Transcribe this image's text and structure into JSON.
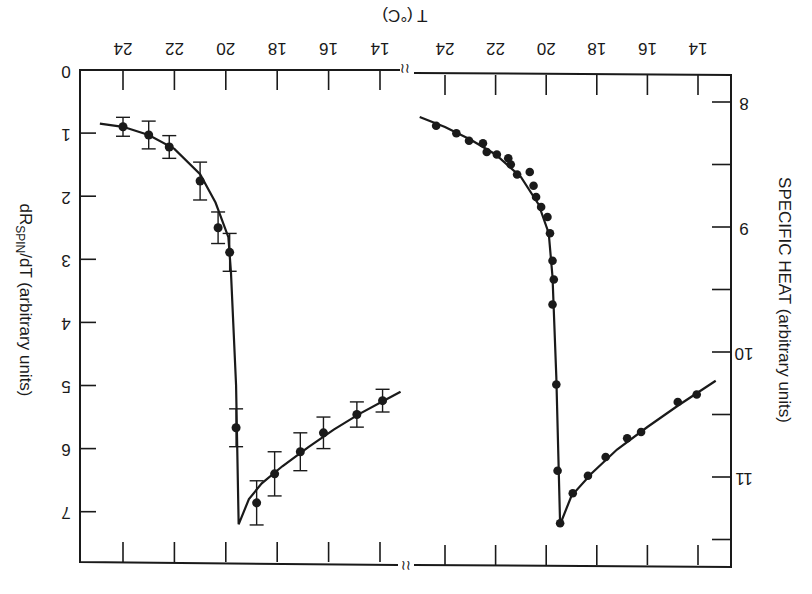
{
  "chart_data": [
    {
      "type": "scatter",
      "orientation": "rotated-180",
      "title": "",
      "xlabel": "T (°C)",
      "ylabel": "dR_SPIN/dT (arbitrary units)",
      "ylabel_main": "dR",
      "ylabel_sub": "SPIN",
      "ylabel_rest": "/dT (arbitrary units)",
      "xticks": [
        24,
        22,
        20,
        18,
        16,
        14
      ],
      "yticks": [
        0,
        1,
        2,
        3,
        4,
        5,
        6,
        7
      ],
      "xlim": [
        24.8,
        12.8
      ],
      "ylim": [
        0,
        7.8
      ],
      "error_bars": true,
      "points": [
        {
          "T": 24.0,
          "v": 0.9,
          "err": 0.15
        },
        {
          "T": 23.0,
          "v": 1.03,
          "err": 0.22
        },
        {
          "T": 22.2,
          "v": 1.22,
          "err": 0.18
        },
        {
          "T": 21.0,
          "v": 1.76,
          "err": 0.3
        },
        {
          "T": 20.3,
          "v": 2.5,
          "err": 0.25
        },
        {
          "T": 19.85,
          "v": 2.89,
          "err": 0.3
        },
        {
          "T": 19.6,
          "v": 5.67,
          "err": 0.3
        },
        {
          "T": 18.8,
          "v": 6.86,
          "err": 0.35
        },
        {
          "T": 18.1,
          "v": 6.4,
          "err": 0.35
        },
        {
          "T": 17.1,
          "v": 6.05,
          "err": 0.3
        },
        {
          "T": 16.2,
          "v": 5.75,
          "err": 0.25
        },
        {
          "T": 14.9,
          "v": 5.46,
          "err": 0.2
        },
        {
          "T": 13.9,
          "v": 5.24,
          "err": 0.18
        }
      ],
      "curve": [
        {
          "T": 24.9,
          "v": 0.85
        },
        {
          "T": 24.0,
          "v": 0.9
        },
        {
          "T": 23.0,
          "v": 1.03
        },
        {
          "T": 22.0,
          "v": 1.25
        },
        {
          "T": 21.0,
          "v": 1.65
        },
        {
          "T": 20.4,
          "v": 2.1
        },
        {
          "T": 19.9,
          "v": 2.65
        },
        {
          "T": 19.8,
          "v": 3.2
        },
        {
          "T": 19.6,
          "v": 5.0
        },
        {
          "T": 19.5,
          "v": 7.2
        },
        {
          "T": 19.1,
          "v": 6.8
        },
        {
          "T": 18.6,
          "v": 6.55
        },
        {
          "T": 17.8,
          "v": 6.28
        },
        {
          "T": 16.8,
          "v": 5.98
        },
        {
          "T": 15.8,
          "v": 5.7
        },
        {
          "T": 14.8,
          "v": 5.45
        },
        {
          "T": 13.8,
          "v": 5.23
        },
        {
          "T": 13.2,
          "v": 5.1
        }
      ]
    },
    {
      "type": "scatter",
      "orientation": "rotated-180",
      "title": "",
      "xlabel": "T (°C)",
      "ylabel": "SPECIFIC HEAT (arbitrary units)",
      "xticks": [
        24,
        22,
        20,
        18,
        16,
        14
      ],
      "yticks": [
        8,
        9,
        10,
        11
      ],
      "ytick_labels": [
        "8",
        "9",
        "10",
        "11"
      ],
      "xlim": [
        24.8,
        12.6
      ],
      "ylim": [
        7.5,
        11.6
      ],
      "error_bars": false,
      "points": [
        {
          "T": 24.35,
          "v": 8.19
        },
        {
          "T": 23.55,
          "v": 8.25
        },
        {
          "T": 23.05,
          "v": 8.31
        },
        {
          "T": 22.5,
          "v": 8.33
        },
        {
          "T": 22.35,
          "v": 8.4
        },
        {
          "T": 21.95,
          "v": 8.42
        },
        {
          "T": 21.5,
          "v": 8.45
        },
        {
          "T": 21.4,
          "v": 8.5
        },
        {
          "T": 21.15,
          "v": 8.58
        },
        {
          "T": 20.65,
          "v": 8.56
        },
        {
          "T": 20.5,
          "v": 8.67
        },
        {
          "T": 20.4,
          "v": 8.76
        },
        {
          "T": 20.2,
          "v": 8.84
        },
        {
          "T": 19.95,
          "v": 8.92
        },
        {
          "T": 19.85,
          "v": 9.05
        },
        {
          "T": 19.75,
          "v": 9.27
        },
        {
          "T": 19.7,
          "v": 9.42
        },
        {
          "T": 19.75,
          "v": 9.62
        },
        {
          "T": 19.6,
          "v": 10.26
        },
        {
          "T": 19.55,
          "v": 10.95
        },
        {
          "T": 19.45,
          "v": 11.37
        },
        {
          "T": 18.95,
          "v": 11.13
        },
        {
          "T": 18.35,
          "v": 10.99
        },
        {
          "T": 17.65,
          "v": 10.84
        },
        {
          "T": 16.8,
          "v": 10.69
        },
        {
          "T": 16.25,
          "v": 10.64
        },
        {
          "T": 14.8,
          "v": 10.4
        },
        {
          "T": 14.05,
          "v": 10.34
        }
      ],
      "curve": [
        {
          "T": 25.0,
          "v": 8.12
        },
        {
          "T": 24.0,
          "v": 8.2
        },
        {
          "T": 23.0,
          "v": 8.3
        },
        {
          "T": 22.0,
          "v": 8.42
        },
        {
          "T": 21.0,
          "v": 8.6
        },
        {
          "T": 20.3,
          "v": 8.82
        },
        {
          "T": 19.9,
          "v": 9.05
        },
        {
          "T": 19.75,
          "v": 9.4
        },
        {
          "T": 19.6,
          "v": 10.2
        },
        {
          "T": 19.45,
          "v": 11.38
        },
        {
          "T": 19.0,
          "v": 11.15
        },
        {
          "T": 18.2,
          "v": 10.97
        },
        {
          "T": 17.2,
          "v": 10.78
        },
        {
          "T": 16.0,
          "v": 10.6
        },
        {
          "T": 14.8,
          "v": 10.43
        },
        {
          "T": 13.3,
          "v": 10.23
        }
      ]
    }
  ],
  "axis_label_top": "T (°C)",
  "left_axis_label": "dR_SPIN/dT (arbitrary units)",
  "right_axis_label": "SPECIFIC HEAT (arbitrary units)"
}
